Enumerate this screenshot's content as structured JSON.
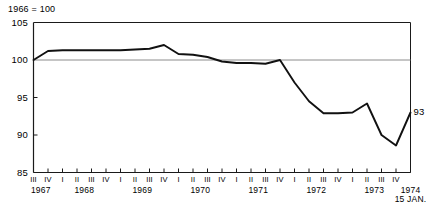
{
  "chart_data": {
    "type": "line",
    "title": "",
    "note": "1966 = 100",
    "xlabel": "",
    "ylabel": "",
    "ylim": [
      85,
      105
    ],
    "yticks": [
      85,
      90,
      95,
      100,
      105
    ],
    "grid": false,
    "reference_line": 100,
    "legend": "none",
    "end_label": "93",
    "end_note": "15 JAN.",
    "categories": [
      "1967 III",
      "1967 IV",
      "1968 I",
      "1968 II",
      "1968 III",
      "1968 IV",
      "1969 I",
      "1969 II",
      "1969 III",
      "1969 IV",
      "1970 I",
      "1970 II",
      "1970 III",
      "1970 IV",
      "1971 I",
      "1971 II",
      "1971 III",
      "1971 IV",
      "1972 I",
      "1972 II",
      "1972 III",
      "1972 IV",
      "1973 I",
      "1973 II",
      "1973 III",
      "1973 IV",
      "1974 15 JAN."
    ],
    "quarter_ticks": [
      "III",
      "IV",
      "I",
      "II",
      "III",
      "IV",
      "I",
      "II",
      "III",
      "IV",
      "I",
      "II",
      "III",
      "IV",
      "I",
      "II",
      "III",
      "IV",
      "I",
      "II",
      "III",
      "IV",
      "I",
      "II",
      "III",
      "IV"
    ],
    "year_groups": [
      {
        "year": "1967",
        "first_tick_index": 0,
        "tick_count": 2
      },
      {
        "year": "1968",
        "first_tick_index": 2,
        "tick_count": 4
      },
      {
        "year": "1969",
        "first_tick_index": 6,
        "tick_count": 4
      },
      {
        "year": "1970",
        "first_tick_index": 10,
        "tick_count": 4
      },
      {
        "year": "1971",
        "first_tick_index": 14,
        "tick_count": 4
      },
      {
        "year": "1972",
        "first_tick_index": 18,
        "tick_count": 4
      },
      {
        "year": "1973",
        "first_tick_index": 22,
        "tick_count": 4
      },
      {
        "year": "1974",
        "first_tick_index": 26,
        "tick_count": 1
      }
    ],
    "values": [
      100.0,
      101.2,
      101.3,
      101.3,
      101.3,
      101.3,
      101.3,
      101.4,
      101.5,
      102.0,
      100.8,
      100.7,
      100.4,
      99.8,
      99.6,
      99.6,
      99.5,
      100.0,
      97.0,
      94.5,
      92.9,
      92.9,
      93.0,
      94.2,
      90.0,
      88.6,
      93.0
    ],
    "line_color": "#111111",
    "axis_color": "#1a1a1a",
    "reference_line_color": "#8c8c8c",
    "background_color": "#ffffff"
  }
}
